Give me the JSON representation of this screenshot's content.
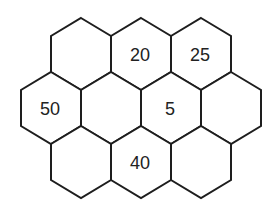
{
  "diagram": {
    "type": "hexagon-grid",
    "colors": {
      "background": "#ffffff",
      "stroke": "#1e1e1e",
      "text": "#222222"
    },
    "geometry": {
      "hex_width": 60,
      "hex_height": 72
    },
    "cells": [
      {
        "id": "r0c0",
        "row": 0,
        "col": 0,
        "cx": 81,
        "cy": 54,
        "label": ""
      },
      {
        "id": "r0c1",
        "row": 0,
        "col": 1,
        "cx": 141,
        "cy": 54,
        "label": "20"
      },
      {
        "id": "r0c2",
        "row": 0,
        "col": 2,
        "cx": 201,
        "cy": 54,
        "label": "25"
      },
      {
        "id": "r1c0",
        "row": 1,
        "col": 0,
        "cx": 51,
        "cy": 108,
        "label": "50"
      },
      {
        "id": "r1c1",
        "row": 1,
        "col": 1,
        "cx": 111,
        "cy": 108,
        "label": ""
      },
      {
        "id": "r1c2",
        "row": 1,
        "col": 2,
        "cx": 171,
        "cy": 108,
        "label": "5"
      },
      {
        "id": "r1c3",
        "row": 1,
        "col": 3,
        "cx": 231,
        "cy": 108,
        "label": ""
      },
      {
        "id": "r2c0",
        "row": 2,
        "col": 0,
        "cx": 81,
        "cy": 162,
        "label": ""
      },
      {
        "id": "r2c1",
        "row": 2,
        "col": 1,
        "cx": 141,
        "cy": 162,
        "label": "40"
      },
      {
        "id": "r2c2",
        "row": 2,
        "col": 2,
        "cx": 201,
        "cy": 162,
        "label": ""
      }
    ]
  }
}
